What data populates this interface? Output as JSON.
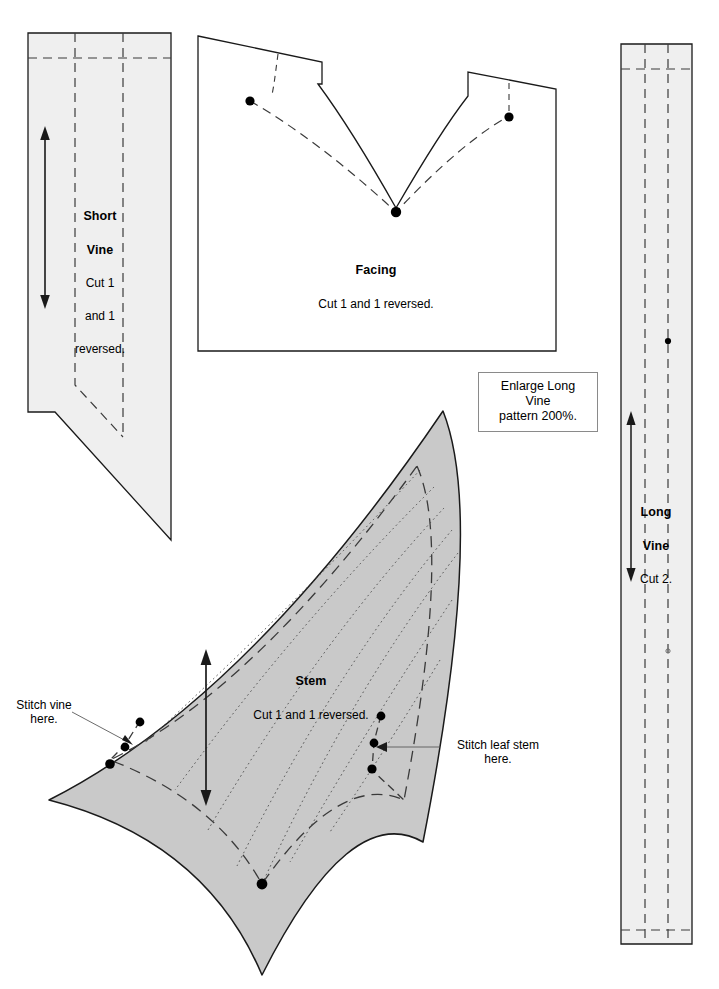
{
  "sheet": {
    "width": 719,
    "height": 989,
    "background": "#ffffff",
    "type": "sewing-pattern-layout-sheet"
  },
  "colors": {
    "outline": "#1a1a1a",
    "piece_light_fill": "#efefef",
    "piece_gray_fill": "#c9c9c9",
    "dash_line": "#3a3a3a",
    "dot_line": "#3a3a3a",
    "note_border": "#8a8a8a",
    "text": "#000000"
  },
  "pieces": [
    {
      "id": "short-vine",
      "title": "Short",
      "title2": "Vine",
      "cut_line1": "Cut 1",
      "cut_line2": "and 1",
      "cut_line3": "reversed.",
      "fill": "#efefef",
      "grainline": "double-arrow-vertical"
    },
    {
      "id": "facing",
      "title": "Facing",
      "cut": "Cut 1 and 1 reversed.",
      "fill": "#ffffff",
      "markers": 3
    },
    {
      "id": "long-vine",
      "title": "Long",
      "title2": "Vine",
      "cut": "Cut 2.",
      "fill": "#efefef",
      "grainline": "double-arrow-vertical",
      "markers": 1
    },
    {
      "id": "stem",
      "title": "Stem",
      "cut": "Cut 1 and 1 reversed.",
      "fill": "#c9c9c9",
      "grainline": "double-arrow-vertical",
      "markers": 7
    }
  ],
  "note": {
    "line1": "Enlarge Long Vine",
    "line2": "pattern 200%."
  },
  "callouts": [
    {
      "id": "stitch-vine",
      "text": "Stitch vine\nhere."
    },
    {
      "id": "stitch-leaf-stem",
      "text": "Stitch leaf stem\nhere."
    }
  ]
}
